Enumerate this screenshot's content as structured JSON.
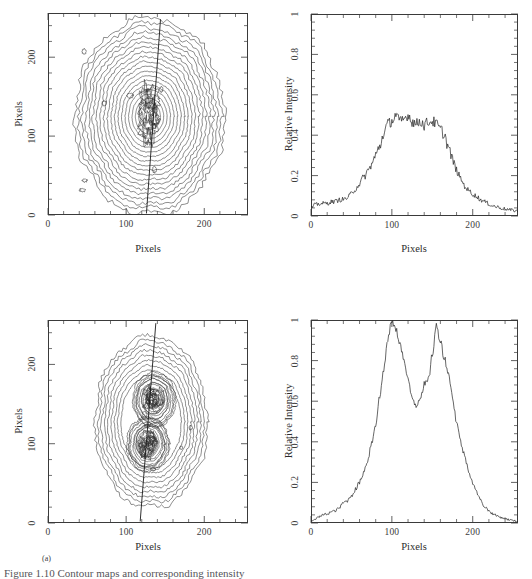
{
  "figure": {
    "sub_label": "(a)",
    "caption_clipped": "Figure 1.10 Contour maps and corresponding intensity"
  },
  "axis_titles": {
    "x": "Pixels",
    "y_contour": "Pixels",
    "y_profile": "Relative Intensity"
  },
  "chart_data": [
    {
      "id": "panel-top-left",
      "type": "heatmap",
      "title": "",
      "xlabel": "Pixels",
      "ylabel": "Pixels",
      "xlim": [
        0,
        256
      ],
      "ylim": [
        0,
        256
      ],
      "xticks": [
        0,
        100,
        200
      ],
      "yticks": [
        0,
        100,
        200
      ],
      "xtick_labels": [
        "0",
        "100",
        "200"
      ],
      "ytick_labels": [
        "0",
        "100",
        "200"
      ],
      "grid": false,
      "legend": "none",
      "representation": "contour-map",
      "n_contour_levels": 19,
      "peak_center": [
        130,
        125
      ],
      "outer_extent_x": [
        35,
        225
      ],
      "outer_extent_y": [
        8,
        243
      ],
      "structure": "single broad elongated peak, noisy concentric contours, slightly vertically elongated",
      "cut_line": {
        "x_top": 144,
        "y_top": 248,
        "x_bottom": 126,
        "y_bottom": 2
      }
    },
    {
      "id": "panel-top-right",
      "type": "line",
      "title": "",
      "xlabel": "Pixels",
      "ylabel": "Relative Intensity",
      "xlim": [
        0,
        256
      ],
      "ylim": [
        0,
        1
      ],
      "xticks": [
        0,
        100,
        200
      ],
      "yticks": [
        0,
        0.2,
        0.4,
        0.6,
        0.8,
        1
      ],
      "xtick_labels": [
        "0",
        "100",
        "200"
      ],
      "ytick_labels": [
        "0",
        "0.2",
        "0.4",
        "0.6",
        "0.8",
        "1"
      ],
      "grid": false,
      "legend": "none",
      "series": [
        {
          "name": "intensity profile",
          "noise_amplitude": 0.028,
          "x": [
            0,
            5,
            10,
            15,
            20,
            25,
            30,
            35,
            40,
            45,
            50,
            55,
            60,
            65,
            70,
            75,
            80,
            85,
            90,
            95,
            100,
            105,
            110,
            115,
            120,
            125,
            130,
            135,
            140,
            145,
            150,
            155,
            160,
            165,
            170,
            175,
            180,
            185,
            190,
            195,
            200,
            205,
            210,
            215,
            220,
            225,
            230,
            235,
            240,
            245,
            250,
            255
          ],
          "values": [
            0.04,
            0.055,
            0.06,
            0.062,
            0.063,
            0.07,
            0.072,
            0.08,
            0.082,
            0.09,
            0.11,
            0.135,
            0.16,
            0.19,
            0.22,
            0.255,
            0.3,
            0.345,
            0.41,
            0.455,
            0.47,
            0.5,
            0.465,
            0.48,
            0.5,
            0.47,
            0.455,
            0.47,
            0.45,
            0.465,
            0.47,
            0.455,
            0.43,
            0.4,
            0.34,
            0.28,
            0.225,
            0.185,
            0.15,
            0.125,
            0.11,
            0.095,
            0.08,
            0.07,
            0.06,
            0.05,
            0.045,
            0.04,
            0.035,
            0.03,
            0.028,
            0.025
          ]
        }
      ]
    },
    {
      "id": "panel-bottom-left",
      "type": "heatmap",
      "title": "",
      "xlabel": "Pixels",
      "ylabel": "Pixels",
      "xlim": [
        0,
        256
      ],
      "ylim": [
        0,
        256
      ],
      "xticks": [
        0,
        100,
        200
      ],
      "yticks": [
        0,
        100,
        200
      ],
      "xtick_labels": [
        "0",
        "100",
        "200"
      ],
      "ytick_labels": [
        "0",
        "100",
        "200"
      ],
      "grid": false,
      "legend": "none",
      "representation": "contour-map",
      "n_contour_levels": 17,
      "structure": "double-lobed (bimodal) source, two dense contour knots",
      "lobe_centers": [
        [
          128,
          100
        ],
        [
          136,
          155
        ]
      ],
      "outer_extent_x": [
        56,
        200
      ],
      "outer_extent_y": [
        14,
        225
      ],
      "cut_line": {
        "x_top": 138,
        "y_top": 252,
        "x_bottom": 118,
        "y_bottom": 2
      }
    },
    {
      "id": "panel-bottom-right",
      "type": "line",
      "title": "",
      "xlabel": "Pixels",
      "ylabel": "Relative Intensity",
      "xlim": [
        0,
        256
      ],
      "ylim": [
        0,
        1
      ],
      "xticks": [
        0,
        100,
        200
      ],
      "yticks": [
        0,
        0.2,
        0.4,
        0.6,
        0.8,
        1
      ],
      "xtick_labels": [
        "0",
        "100",
        "200"
      ],
      "ytick_labels": [
        "0",
        "0.2",
        "0.4",
        "0.6",
        "0.8",
        "1"
      ],
      "grid": false,
      "legend": "none",
      "series": [
        {
          "name": "intensity profile",
          "noise_amplitude": 0.018,
          "peaks": [
            {
              "x": 100,
              "y": 1.0
            },
            {
              "x": 156,
              "y": 0.97
            }
          ],
          "valley": {
            "x": 132,
            "y": 0.575
          },
          "x": [
            0,
            5,
            10,
            15,
            20,
            25,
            30,
            35,
            40,
            45,
            50,
            55,
            60,
            65,
            70,
            75,
            80,
            85,
            90,
            95,
            100,
            105,
            110,
            115,
            120,
            125,
            130,
            135,
            140,
            145,
            150,
            155,
            160,
            165,
            170,
            175,
            180,
            185,
            190,
            195,
            200,
            205,
            210,
            215,
            220,
            225,
            230,
            235,
            240,
            245,
            250,
            255
          ],
          "values": [
            0.01,
            0.02,
            0.03,
            0.04,
            0.045,
            0.055,
            0.06,
            0.075,
            0.1,
            0.11,
            0.135,
            0.165,
            0.2,
            0.25,
            0.31,
            0.395,
            0.49,
            0.62,
            0.76,
            0.9,
            1.0,
            0.95,
            0.89,
            0.8,
            0.7,
            0.62,
            0.58,
            0.62,
            0.68,
            0.7,
            0.83,
            0.97,
            0.9,
            0.81,
            0.74,
            0.62,
            0.5,
            0.4,
            0.33,
            0.26,
            0.2,
            0.15,
            0.11,
            0.08,
            0.06,
            0.045,
            0.035,
            0.028,
            0.022,
            0.016,
            0.012,
            0.008
          ]
        }
      ]
    }
  ]
}
